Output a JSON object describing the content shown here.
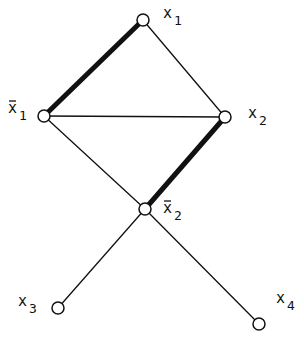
{
  "diagram": {
    "type": "graph",
    "nodes": [
      {
        "id": "x1",
        "label": "x",
        "subscript": "1",
        "bar": false,
        "x": 143,
        "y": 20,
        "lx": 163,
        "ly": 18
      },
      {
        "id": "nx1",
        "label": "x",
        "subscript": "1",
        "bar": true,
        "x": 44,
        "y": 116,
        "lx": 8,
        "ly": 113
      },
      {
        "id": "x2",
        "label": "x",
        "subscript": "2",
        "bar": false,
        "x": 225,
        "y": 117,
        "lx": 248,
        "ly": 118
      },
      {
        "id": "nx2",
        "label": "x",
        "subscript": "2",
        "bar": true,
        "x": 145,
        "y": 209,
        "lx": 163,
        "ly": 213
      },
      {
        "id": "x3",
        "label": "x",
        "subscript": "3",
        "bar": false,
        "x": 58,
        "y": 308,
        "lx": 18,
        "ly": 306
      },
      {
        "id": "x4",
        "label": "x",
        "subscript": "4",
        "bar": false,
        "x": 259,
        "y": 324,
        "lx": 276,
        "ly": 303
      }
    ],
    "edges": [
      {
        "from": "x1",
        "to": "nx1",
        "bold": true
      },
      {
        "from": "x1",
        "to": "x2",
        "bold": false
      },
      {
        "from": "nx1",
        "to": "x2",
        "bold": false
      },
      {
        "from": "nx1",
        "to": "nx2",
        "bold": false
      },
      {
        "from": "x2",
        "to": "nx2",
        "bold": true
      },
      {
        "from": "nx2",
        "to": "x3",
        "bold": false
      },
      {
        "from": "nx2",
        "to": "x4",
        "bold": false
      }
    ],
    "colors": {
      "line": "#111111",
      "background": "#ffffff"
    }
  }
}
